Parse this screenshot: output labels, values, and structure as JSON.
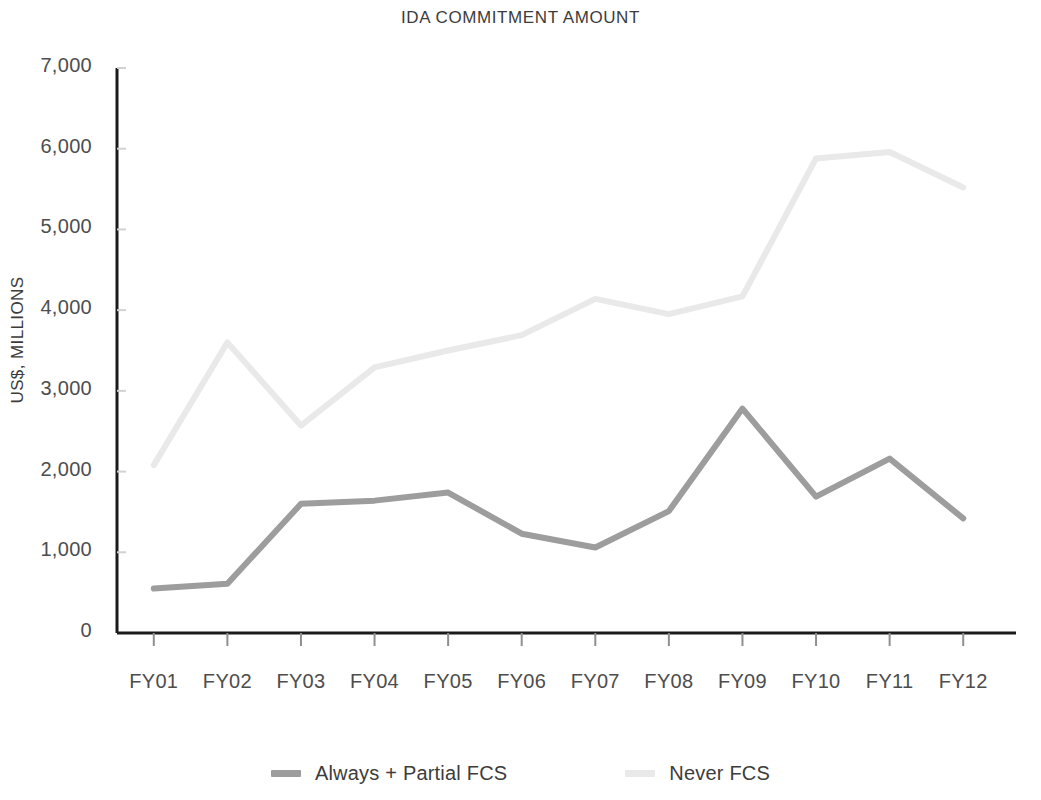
{
  "chart_data": {
    "type": "line",
    "title": "IDA COMMITMENT AMOUNT",
    "xlabel": "",
    "ylabel": "US$, MILLIONS",
    "categories": [
      "FY01",
      "FY02",
      "FY03",
      "FY04",
      "FY05",
      "FY06",
      "FY07",
      "FY08",
      "FY09",
      "FY10",
      "FY11",
      "FY12"
    ],
    "ylim": [
      0,
      7000
    ],
    "ytick_labels": [
      "7,000",
      "6,000",
      "5,000",
      "4,000",
      "3,000",
      "2,000",
      "1,000",
      "0"
    ],
    "ytick_values": [
      7000,
      6000,
      5000,
      4000,
      3000,
      2000,
      1000,
      0
    ],
    "grid": false,
    "legend_position": "bottom",
    "series": [
      {
        "name": "Always + Partial FCS",
        "color": "#9d9d9d",
        "values": [
          550,
          610,
          1600,
          1640,
          1740,
          1230,
          1060,
          1510,
          2780,
          1690,
          2160,
          1420
        ]
      },
      {
        "name": "Never FCS",
        "color": "#e9e9e9",
        "values": [
          2080,
          3600,
          2570,
          3290,
          3500,
          3690,
          4140,
          3950,
          4170,
          5880,
          5960,
          5520
        ]
      }
    ]
  },
  "axis": {
    "line_color": "#1a1a1a"
  }
}
